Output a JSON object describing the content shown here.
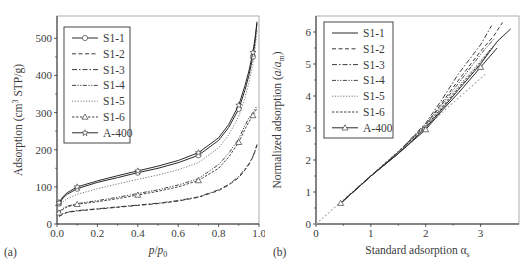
{
  "chart_data": [
    {
      "panel_label": "(a)",
      "type": "line",
      "title": "",
      "xlabel": "p/p0",
      "ylabel": "Adsorption (cm3 STP/g)",
      "xlim": [
        0,
        1.0
      ],
      "ylim": [
        0,
        560
      ],
      "xticks": [
        "0.0",
        "0.2",
        "0.4",
        "0.6",
        "0.8",
        "1.0"
      ],
      "yticks": [
        "0",
        "100",
        "200",
        "300",
        "400",
        "500"
      ],
      "grid": false,
      "legend_position": "upper-left",
      "x": [
        0.01,
        0.03,
        0.05,
        0.1,
        0.2,
        0.3,
        0.4,
        0.5,
        0.6,
        0.7,
        0.8,
        0.85,
        0.9,
        0.93,
        0.95,
        0.97,
        0.98,
        0.99
      ],
      "series": [
        {
          "name": "S1-1",
          "style": "solid",
          "marker": "circle",
          "values": [
            55,
            70,
            80,
            95,
            112,
            125,
            138,
            150,
            165,
            185,
            225,
            260,
            310,
            360,
            400,
            450,
            490,
            540
          ]
        },
        {
          "name": "S1-2",
          "style": "dashed",
          "marker": "none",
          "values": [
            20,
            27,
            31,
            35,
            40,
            45,
            50,
            55,
            62,
            72,
            90,
            105,
            125,
            145,
            160,
            180,
            195,
            215
          ]
        },
        {
          "name": "S1-3",
          "style": "dashdot",
          "marker": "none",
          "values": [
            22,
            28,
            32,
            36,
            41,
            46,
            51,
            56,
            63,
            73,
            92,
            106,
            128,
            148,
            162,
            182,
            198,
            212
          ]
        },
        {
          "name": "S1-4",
          "style": "dashdotdot",
          "marker": "none",
          "values": [
            32,
            42,
            48,
            55,
            63,
            72,
            82,
            92,
            105,
            122,
            160,
            190,
            230,
            265,
            285,
            300,
            310,
            318
          ]
        },
        {
          "name": "S1-5",
          "style": "dotted",
          "marker": "none",
          "values": [
            48,
            60,
            68,
            80,
            95,
            108,
            120,
            132,
            146,
            165,
            205,
            240,
            290,
            340,
            380,
            430,
            470,
            520
          ]
        },
        {
          "name": "S1-6",
          "style": "shortdash",
          "marker": "triangle",
          "values": [
            30,
            40,
            46,
            53,
            60,
            68,
            78,
            88,
            100,
            117,
            150,
            180,
            220,
            255,
            275,
            292,
            302,
            312
          ]
        },
        {
          "name": "A-400",
          "style": "solid",
          "marker": "star",
          "values": [
            58,
            74,
            84,
            100,
            116,
            130,
            143,
            156,
            171,
            192,
            232,
            268,
            320,
            372,
            412,
            462,
            500,
            545
          ]
        }
      ]
    },
    {
      "panel_label": "(b)",
      "type": "line",
      "title": "",
      "xlabel": "Standard adsorption αs",
      "ylabel": "Normalized adsorption (a/am)",
      "xlim": [
        0,
        3.7
      ],
      "ylim": [
        0,
        6.5
      ],
      "xticks": [
        "0",
        "1",
        "2",
        "3"
      ],
      "yticks": [
        "0",
        "1",
        "2",
        "3",
        "4",
        "5",
        "6"
      ],
      "grid": false,
      "legend_position": "upper-left",
      "reference_line": {
        "style": "dotted-gray",
        "x": [
          0,
          3.1
        ],
        "y": [
          0,
          4.7
        ]
      },
      "series": [
        {
          "name": "S1-1",
          "style": "solid",
          "marker": "none",
          "x": [
            0.45,
            1.0,
            1.5,
            2.0,
            2.3,
            2.6,
            3.0,
            3.3,
            3.55
          ],
          "values": [
            0.65,
            1.5,
            2.2,
            3.0,
            3.6,
            4.2,
            5.0,
            5.7,
            6.1
          ]
        },
        {
          "name": "S1-2",
          "style": "dashed",
          "marker": "none",
          "x": [
            0.45,
            1.0,
            1.5,
            2.0,
            2.3,
            2.6,
            3.0,
            3.25,
            3.4
          ],
          "values": [
            0.65,
            1.5,
            2.25,
            3.1,
            3.8,
            4.5,
            5.4,
            5.9,
            6.3
          ]
        },
        {
          "name": "S1-3",
          "style": "dashdot",
          "marker": "none",
          "x": [
            0.45,
            1.0,
            1.5,
            2.0,
            2.3,
            2.6,
            3.0,
            3.2
          ],
          "values": [
            0.65,
            1.5,
            2.25,
            3.15,
            3.9,
            4.7,
            5.6,
            6.2
          ]
        },
        {
          "name": "S1-4",
          "style": "dashdotdot",
          "marker": "none",
          "x": [
            0.45,
            1.0,
            1.5,
            2.0,
            2.3,
            2.6,
            3.0,
            3.25
          ],
          "values": [
            0.65,
            1.5,
            2.25,
            3.1,
            3.75,
            4.4,
            5.3,
            5.8
          ]
        },
        {
          "name": "S1-5",
          "style": "dotted",
          "marker": "none",
          "x": [
            0.45,
            1.0,
            1.5,
            2.0,
            2.3,
            2.6,
            3.0,
            3.25
          ],
          "values": [
            0.65,
            1.5,
            2.25,
            3.05,
            3.7,
            4.3,
            5.1,
            5.6
          ]
        },
        {
          "name": "S1-6",
          "style": "shortdash",
          "marker": "none",
          "x": [
            0.45,
            1.0,
            1.5,
            2.0,
            2.3,
            2.6,
            3.0,
            3.2
          ],
          "values": [
            0.65,
            1.5,
            2.25,
            3.05,
            3.65,
            4.25,
            5.05,
            5.5
          ]
        },
        {
          "name": "A-400",
          "style": "solid",
          "marker": "triangle",
          "x": [
            0.45,
            1.0,
            1.5,
            2.0,
            2.3,
            2.6,
            3.0,
            3.3
          ],
          "values": [
            0.65,
            1.5,
            2.2,
            2.95,
            3.55,
            4.1,
            4.9,
            5.5
          ]
        }
      ]
    }
  ]
}
